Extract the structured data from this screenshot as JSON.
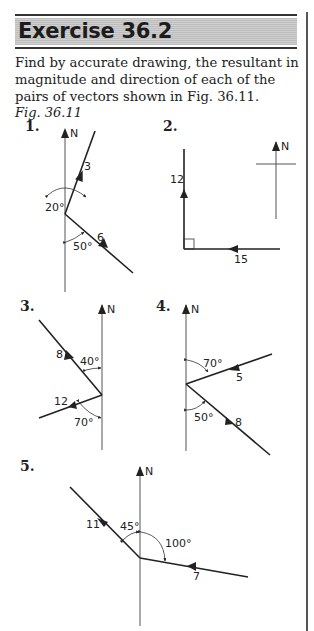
{
  "header": {
    "title": "Exercise 36.2"
  },
  "intro": {
    "text": "Find by accurate drawing, the resultant in magnitude and direction of each of the pairs of vectors shown in Fig. 36.11."
  },
  "caption": "Fig. 36.11",
  "north_label": "N",
  "figures": [
    {
      "number": "1.",
      "vectors": [
        {
          "magnitude": "3",
          "bearing_desc": "20° east of north"
        },
        {
          "magnitude": "6",
          "bearing_desc": "50° from south, pointing north-west"
        }
      ],
      "angles": [
        "20°",
        "50°"
      ]
    },
    {
      "number": "2.",
      "vectors": [
        {
          "magnitude": "12",
          "bearing_desc": "north"
        },
        {
          "magnitude": "15",
          "bearing_desc": "west"
        }
      ],
      "angles": []
    },
    {
      "number": "3.",
      "vectors": [
        {
          "magnitude": "8",
          "bearing_desc": "pointing south-east, 40° from north"
        },
        {
          "magnitude": "12",
          "bearing_desc": "pointing west-south-west, 70° from south"
        }
      ],
      "angles": [
        "40°",
        "70°"
      ]
    },
    {
      "number": "4.",
      "vectors": [
        {
          "magnitude": "5",
          "bearing_desc": "pointing west-south-west, 70° from north"
        },
        {
          "magnitude": "8",
          "bearing_desc": "pointing south-east, 50° from south"
        }
      ],
      "angles": [
        "70°",
        "50°"
      ]
    },
    {
      "number": "5.",
      "vectors": [
        {
          "magnitude": "11",
          "bearing_desc": "pointing north-west, 45° from north"
        },
        {
          "magnitude": "7",
          "bearing_desc": "pointing west, 100° from north"
        }
      ],
      "angles": [
        "45°",
        "100°"
      ]
    }
  ]
}
